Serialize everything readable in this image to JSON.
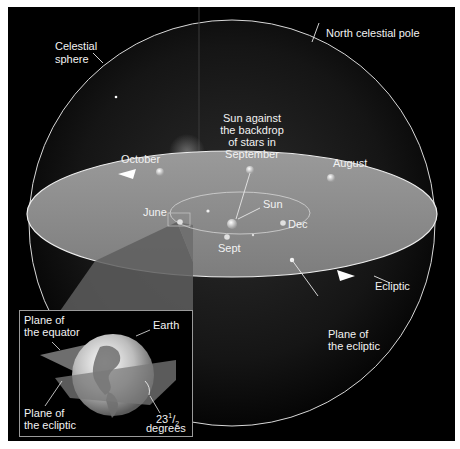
{
  "diagram": {
    "background_color": "#000000",
    "ecliptic_plane_color": "#8c8c8c",
    "line_color": "#e6e6e6",
    "labels": {
      "north_celestial_pole": "North celestial pole",
      "celestial_sphere_line1": "Celestial",
      "celestial_sphere_line2": "sphere",
      "sun_backdrop_line1": "Sun against",
      "sun_backdrop_line2": "the backdrop",
      "sun_backdrop_line3": "of stars in",
      "sun_backdrop_line4": "September",
      "october": "October",
      "august": "August",
      "june": "June",
      "sun": "Sun",
      "dec": "Dec",
      "sept": "Sept",
      "ecliptic": "Ecliptic",
      "plane_of_ecliptic_line1": "Plane of",
      "plane_of_ecliptic_line2": "the ecliptic"
    },
    "inset": {
      "plane_of_equator_line1": "Plane of",
      "plane_of_equator_line2": "the equator",
      "earth": "Earth",
      "plane_of_ecliptic_line1": "Plane of",
      "plane_of_ecliptic_line2": "the ecliptic",
      "tilt_whole": "23",
      "tilt_num": "1",
      "tilt_den": "2",
      "tilt_unit": "degrees"
    }
  }
}
